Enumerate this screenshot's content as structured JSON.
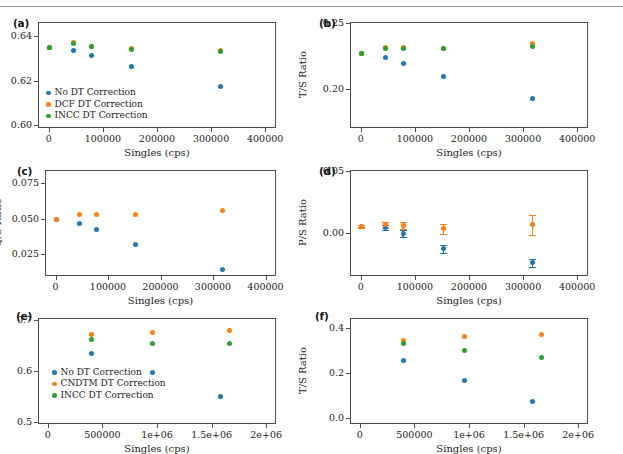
{
  "figure": {
    "has_top_rule": true,
    "colors": {
      "no_dt": "#1f77b4",
      "dcf_dt": "#ff7f0e",
      "cndtm_dt": "#ff7f0e",
      "incc_dt": "#2ca02c",
      "axis": "#4d4d4d",
      "text": "#222222"
    },
    "shared_xlabel": "Singles (cps)"
  },
  "chart_data": [
    {
      "id": "a",
      "type": "scatter",
      "panel_label": "(a)",
      "title": "",
      "xlabel": "Singles (cps)",
      "ylabel": "D/S Ratio",
      "xlim": [
        -20000,
        420000
      ],
      "ylim": [
        0.5985,
        0.6465
      ],
      "xticks": [
        0,
        100000,
        200000,
        300000,
        400000
      ],
      "xticklabels": [
        "0",
        "100000",
        "200000",
        "300000",
        "400000"
      ],
      "yticks": [
        0.6,
        0.62,
        0.64
      ],
      "yticklabels": [
        "0.60",
        "0.62",
        "0.64"
      ],
      "grid": false,
      "legend_position": "lower left",
      "series": [
        {
          "name": "No DT Correction",
          "color": "#1f77b4",
          "x": [
            2000,
            45000,
            78000,
            153000,
            318000
          ],
          "y": [
            0.635,
            0.6338,
            0.6313,
            0.6262,
            0.6175
          ]
        },
        {
          "name": "DCF DT Correction",
          "color": "#ff7f0e",
          "x": [
            2000,
            45000,
            78000,
            153000,
            318000
          ],
          "y": [
            0.635,
            0.6372,
            0.6355,
            0.6343,
            0.6337
          ]
        },
        {
          "name": "INCC DT Correction",
          "color": "#2ca02c",
          "x": [
            2000,
            45000,
            78000,
            153000,
            318000
          ],
          "y": [
            0.635,
            0.6368,
            0.6352,
            0.6339,
            0.6332
          ]
        }
      ]
    },
    {
      "id": "b",
      "type": "scatter",
      "panel_label": "(b)",
      "title": "",
      "xlabel": "Singles (cps)",
      "ylabel": "T/S Ratio",
      "xlim": [
        -20000,
        420000
      ],
      "ylim": [
        0.1705,
        0.2505
      ],
      "xticks": [
        0,
        100000,
        200000,
        300000,
        400000
      ],
      "xticklabels": [
        "0",
        "100000",
        "200000",
        "300000",
        "400000"
      ],
      "yticks": [
        0.2,
        0.25
      ],
      "yticklabels": [
        "0.20",
        "0.25"
      ],
      "grid": false,
      "legend_position": "none",
      "series": [
        {
          "name": "No DT Correction",
          "color": "#1f77b4",
          "x": [
            2000,
            45000,
            78000,
            153000,
            318000
          ],
          "y": [
            0.227,
            0.224,
            0.2195,
            0.209,
            0.193
          ]
        },
        {
          "name": "DCF DT Correction",
          "color": "#ff7f0e",
          "x": [
            2000,
            45000,
            78000,
            153000,
            318000
          ],
          "y": [
            0.227,
            0.231,
            0.231,
            0.2308,
            0.234
          ]
        },
        {
          "name": "INCC DT Correction",
          "color": "#2ca02c",
          "x": [
            2000,
            45000,
            78000,
            153000,
            318000
          ],
          "y": [
            0.227,
            0.2308,
            0.2308,
            0.2305,
            0.232
          ]
        }
      ]
    },
    {
      "id": "c",
      "type": "scatter",
      "panel_label": "(c)",
      "title": "",
      "xlabel": "Singles (cps)",
      "ylabel": "Q/S Ratio",
      "xlim": [
        -20000,
        420000
      ],
      "ylim": [
        0.0095,
        0.0845
      ],
      "xticks": [
        0,
        100000,
        200000,
        300000,
        400000
      ],
      "xticklabels": [
        "0",
        "100000",
        "200000",
        "300000",
        "400000"
      ],
      "yticks": [
        0.025,
        0.05,
        0.075
      ],
      "yticklabels": [
        "0.025",
        "0.050",
        "0.075"
      ],
      "grid": false,
      "legend_position": "none",
      "series": [
        {
          "name": "No DT Correction",
          "color": "#1f77b4",
          "x": [
            2000,
            45000,
            78000,
            153000,
            318000
          ],
          "y": [
            0.0492,
            0.0466,
            0.0424,
            0.0318,
            0.014
          ]
        },
        {
          "name": "DCF DT Correction",
          "color": "#ff7f0e",
          "x": [
            2000,
            45000,
            78000,
            153000,
            318000
          ],
          "y": [
            0.0492,
            0.053,
            0.0531,
            0.0531,
            0.0558
          ]
        }
      ]
    },
    {
      "id": "d",
      "type": "scatter",
      "panel_label": "(d)",
      "title": "",
      "xlabel": "Singles (cps)",
      "ylabel": "P/S Ratio",
      "xlim": [
        -20000,
        420000
      ],
      "ylim": [
        -0.0345,
        0.0505
      ],
      "xticks": [
        0,
        100000,
        200000,
        300000,
        400000
      ],
      "xticklabels": [
        "0",
        "100000",
        "200000",
        "300000",
        "400000"
      ],
      "yticks": [
        0.0,
        0.05
      ],
      "yticklabels": [
        "0.00",
        "0.05"
      ],
      "grid": false,
      "legend_position": "none",
      "has_errorbars": true,
      "series": [
        {
          "name": "No DT Correction",
          "color": "#1f77b4",
          "x": [
            2000,
            45000,
            78000,
            153000,
            318000
          ],
          "y": [
            0.0055,
            0.0045,
            -0.0005,
            -0.0125,
            -0.024
          ],
          "yerr": [
            0.001,
            0.0022,
            0.0028,
            0.0032,
            0.0035
          ]
        },
        {
          "name": "DCF DT Correction",
          "color": "#ff7f0e",
          "x": [
            2000,
            45000,
            78000,
            153000,
            318000
          ],
          "y": [
            0.0055,
            0.0065,
            0.0062,
            0.0035,
            0.0065
          ],
          "yerr": [
            0.001,
            0.0025,
            0.003,
            0.004,
            0.0082
          ]
        }
      ]
    },
    {
      "id": "e",
      "type": "scatter",
      "panel_label": "(e)",
      "title": "",
      "xlabel": "Singles (cps)",
      "ylabel": "D/S Ratio",
      "xlim": [
        -90000,
        2090000
      ],
      "ylim": [
        0.4965,
        0.7035
      ],
      "xticks": [
        0,
        500000,
        1000000,
        1500000,
        2000000
      ],
      "xticklabels": [
        "0",
        "500000",
        "1e+06",
        "1.5e+06",
        "2e+06"
      ],
      "yticks": [
        0.5,
        0.6,
        0.7
      ],
      "yticklabels": [
        "0.5",
        "0.6",
        "0.7"
      ],
      "grid": false,
      "legend_position": "center left",
      "series": [
        {
          "name": "No DT Correction",
          "color": "#1f77b4",
          "x": [
            400000,
            960000,
            1580000
          ],
          "y": [
            0.635,
            0.5975,
            0.55
          ]
        },
        {
          "name": "CNDTM DT Correction",
          "color": "#ff7f0e",
          "x": [
            400000,
            960000,
            1660000
          ],
          "y": [
            0.672,
            0.676,
            0.679
          ]
        },
        {
          "name": "INCC DT Correction",
          "color": "#2ca02c",
          "x": [
            400000,
            960000,
            1660000
          ],
          "y": [
            0.661,
            0.6545,
            0.653
          ]
        }
      ]
    },
    {
      "id": "f",
      "type": "scatter",
      "panel_label": "(f)",
      "title": "",
      "xlabel": "Singles (cps)",
      "ylabel": "T/S Ratio",
      "xlim": [
        -90000,
        2090000
      ],
      "ylim": [
        -0.028,
        0.445
      ],
      "xticks": [
        0,
        500000,
        1000000,
        1500000,
        2000000
      ],
      "xticklabels": [
        "0",
        "500000",
        "1e+06",
        "1.5e+06",
        "2e+06"
      ],
      "yticks": [
        0.0,
        0.2,
        0.4
      ],
      "yticklabels": [
        "0.0",
        "0.2",
        "0.4"
      ],
      "grid": false,
      "legend_position": "none",
      "series": [
        {
          "name": "No DT Correction",
          "color": "#1f77b4",
          "x": [
            400000,
            960000,
            1580000
          ],
          "y": [
            0.257,
            0.166,
            0.072
          ]
        },
        {
          "name": "CNDTM DT Correction",
          "color": "#ff7f0e",
          "x": [
            400000,
            960000,
            1660000
          ],
          "y": [
            0.344,
            0.362,
            0.371
          ]
        },
        {
          "name": "INCC DT Correction",
          "color": "#2ca02c",
          "x": [
            400000,
            960000,
            1660000
          ],
          "y": [
            0.329,
            0.301,
            0.268
          ]
        }
      ]
    }
  ],
  "panels_geometry": [
    {
      "id": "a",
      "left": 38,
      "top": 12,
      "width": 238,
      "height": 106,
      "label_left": 13,
      "label_top": 7
    },
    {
      "id": "b",
      "left": 350,
      "top": 12,
      "width": 238,
      "height": 106,
      "label_left": 319,
      "label_top": 7
    },
    {
      "id": "c",
      "left": 45,
      "top": 160,
      "width": 231,
      "height": 106,
      "label_left": 17,
      "label_top": 155
    },
    {
      "id": "d",
      "left": 350,
      "top": 160,
      "width": 238,
      "height": 106,
      "label_left": 319,
      "label_top": 155
    },
    {
      "id": "e",
      "left": 38,
      "top": 308,
      "width": 238,
      "height": 106,
      "label_left": 16,
      "label_top": 300
    },
    {
      "id": "f",
      "left": 350,
      "top": 308,
      "width": 238,
      "height": 106,
      "label_left": 315,
      "label_top": 300
    }
  ]
}
